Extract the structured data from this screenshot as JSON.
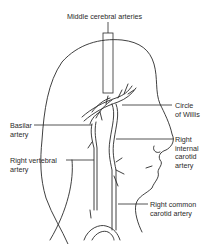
{
  "diagram": {
    "labels": {
      "middle_cerebral": "Middle cerebral arteries",
      "circle_of_willis": [
        "Circle",
        "of Willis"
      ],
      "basilar": [
        "Basilar",
        "artery"
      ],
      "right_vertebral": [
        "Right vertebral",
        "artery"
      ],
      "right_internal_carotid": [
        "Right",
        "internal",
        "carotid",
        "artery"
      ],
      "right_common_carotid": [
        "Right common",
        "carotid artery"
      ]
    },
    "colors": {
      "line": "#2a2a2a",
      "background": "#ffffff"
    }
  }
}
